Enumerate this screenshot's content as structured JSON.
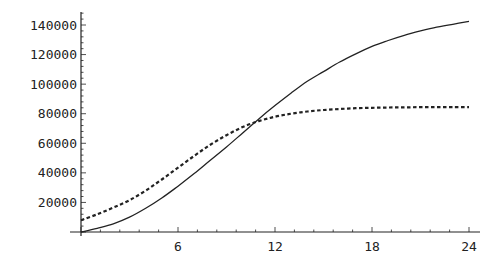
{
  "chart_data": {
    "type": "line",
    "title": "",
    "xlabel": "",
    "ylabel": "",
    "xlim": [
      0,
      24
    ],
    "ylim": [
      0,
      148000
    ],
    "grid": false,
    "legend": null,
    "x_ticks": [
      6,
      12,
      18,
      24
    ],
    "y_ticks": [
      20000,
      40000,
      60000,
      80000,
      100000,
      120000,
      140000
    ],
    "x_tick_labels": [
      "6",
      "12",
      "18",
      "24"
    ],
    "y_tick_labels": [
      "20000",
      "40000",
      "60000",
      "80000",
      "100000",
      "120000",
      "140000"
    ],
    "x": [
      0,
      1,
      2,
      3,
      4,
      5,
      6,
      7,
      8,
      9,
      10,
      11,
      12,
      13,
      14,
      15,
      16,
      17,
      18,
      19,
      20,
      21,
      22,
      23,
      24
    ],
    "series": [
      {
        "name": "solid",
        "style": "solid",
        "color": "#222222",
        "values": [
          0,
          2500,
          5500,
          10000,
          16000,
          23000,
          31000,
          39500,
          48500,
          57500,
          67000,
          76500,
          85500,
          94000,
          102000,
          108500,
          115000,
          120500,
          125500,
          129500,
          133000,
          136000,
          138500,
          140500,
          142500
        ]
      },
      {
        "name": "dashed",
        "style": "dashed",
        "color": "#222222",
        "values": [
          8000,
          12000,
          16500,
          21500,
          28000,
          35500,
          43500,
          51500,
          59000,
          65500,
          71000,
          75000,
          78000,
          80000,
          81500,
          82500,
          83200,
          83700,
          84000,
          84200,
          84300,
          84400,
          84400,
          84500,
          84500
        ]
      }
    ],
    "annotations": [
      {
        "text": "curves cross",
        "x": 11,
        "y": 86000
      }
    ]
  }
}
